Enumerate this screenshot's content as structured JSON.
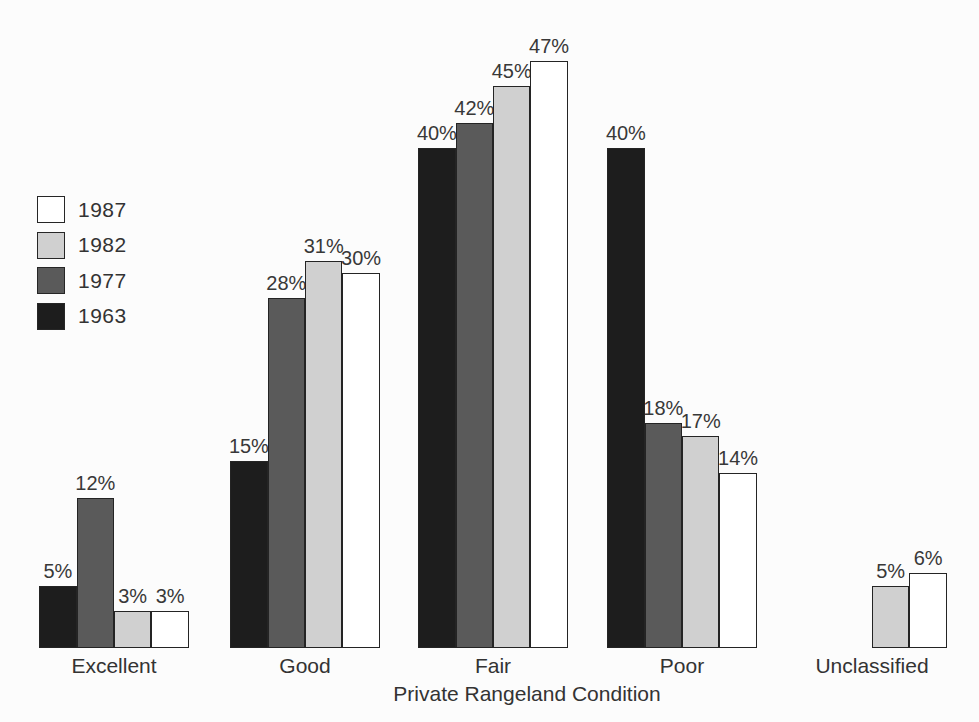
{
  "chart_data": {
    "type": "bar",
    "title": "",
    "xlabel": "Private Rangeland Condition",
    "ylabel": "",
    "ylim": [
      0,
      50
    ],
    "grid": false,
    "legend_position": "upper-left",
    "value_label_suffix": "%",
    "categories": [
      "Excellent",
      "Good",
      "Fair",
      "Poor",
      "Unclassified"
    ],
    "series": [
      {
        "name": "1987",
        "color": "#ffffff",
        "values": [
          3,
          30,
          47,
          14,
          6
        ]
      },
      {
        "name": "1982",
        "color": "#d0d0d0",
        "values": [
          3,
          31,
          45,
          17,
          5
        ]
      },
      {
        "name": "1977",
        "color": "#5a5a5a",
        "values": [
          12,
          28,
          42,
          18,
          null
        ]
      },
      {
        "name": "1963",
        "color": "#1d1d1d",
        "values": [
          5,
          15,
          40,
          40,
          null
        ]
      }
    ],
    "bar_order_left_to_right": [
      "1963",
      "1977",
      "1982",
      "1987"
    ],
    "colors": {
      "background": "#fcfcfc",
      "bar_border": "#242424",
      "text": "#333333"
    }
  }
}
